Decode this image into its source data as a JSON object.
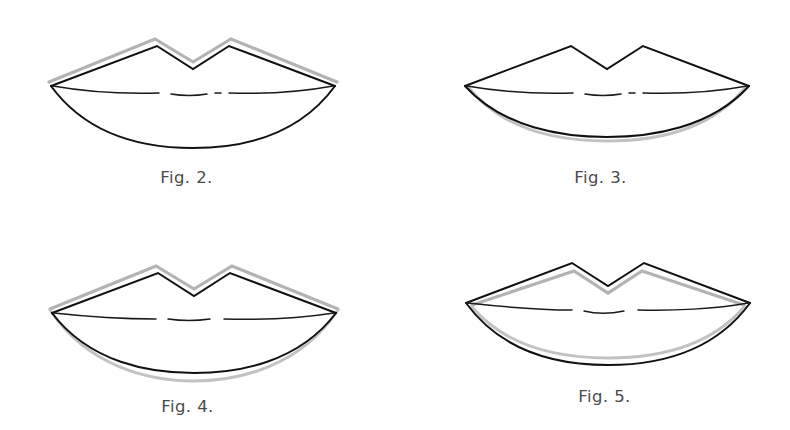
{
  "page": {
    "background_color": "#ffffff",
    "ink_color": "#111111",
    "guide_color": "#b3b3b3",
    "caption_color": "#4a4a4a",
    "kind": "line-drawing-plate"
  },
  "figures": [
    {
      "id": "fig-2",
      "caption": "Fig. 2.",
      "subject": "lips-outline",
      "guide_placement": "outside-upper-lip",
      "guide_description": "grey guide line traced above and outside the upper lip contour",
      "lower_lip_shape": "deep-rounded",
      "mouth_line": "dashed"
    },
    {
      "id": "fig-3",
      "caption": "Fig. 3.",
      "subject": "lips-outline",
      "guide_placement": "outside-lower-lip",
      "guide_description": "grey guide line traced below and outside the lower lip contour",
      "lower_lip_shape": "shallow-rounded",
      "mouth_line": "dashed"
    },
    {
      "id": "fig-4",
      "caption": "Fig. 4.",
      "subject": "lips-outline",
      "guide_placement": "outside-both-lips",
      "guide_description": "grey guide line traced outside both the upper and the lower lip contours",
      "lower_lip_shape": "deep-rounded",
      "mouth_line": "dashed"
    },
    {
      "id": "fig-5",
      "caption": "Fig. 5.",
      "subject": "lips-outline",
      "guide_placement": "inside-both-lips",
      "guide_description": "grey guide line traced inside both the upper and the lower lip contours",
      "lower_lip_shape": "deep-rounded",
      "mouth_line": "dashed"
    }
  ]
}
